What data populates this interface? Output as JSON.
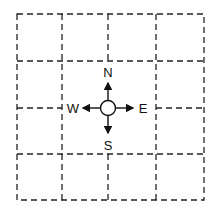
{
  "diagram": {
    "type": "grid-with-compass",
    "grid": {
      "columns": 4,
      "rows": 4,
      "line_style": "dashed",
      "line_color": "#222222"
    },
    "compass": {
      "labels": {
        "north": "N",
        "south": "S",
        "east": "E",
        "west": "W"
      },
      "center": "circle"
    }
  }
}
